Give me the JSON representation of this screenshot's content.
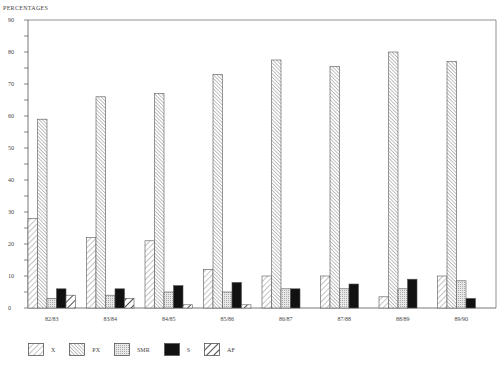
{
  "chart_data": {
    "type": "bar",
    "title": "",
    "ylabel": "PERCENTAGES",
    "xlabel": "",
    "ylim": [
      0,
      90
    ],
    "yticks": [
      0,
      10,
      20,
      30,
      40,
      50,
      60,
      70,
      80,
      90
    ],
    "grid": false,
    "legend_position": "bottom",
    "categories": [
      "82/83",
      "83/84",
      "84/85",
      "85/86",
      "86/87",
      "87/88",
      "88/89",
      "89/90"
    ],
    "series": [
      {
        "name": "X",
        "pattern": "diag-light",
        "values": [
          28,
          22,
          21,
          12,
          10,
          10,
          3.5,
          10
        ]
      },
      {
        "name": "PX",
        "pattern": "diag-dense",
        "values": [
          59,
          66,
          67,
          73,
          77.5,
          75.5,
          80,
          77
        ]
      },
      {
        "name": "SMR",
        "pattern": "dots",
        "values": [
          3,
          4,
          5,
          5,
          6,
          6,
          6,
          8.5
        ]
      },
      {
        "name": "S",
        "pattern": "solid-black",
        "values": [
          6,
          6,
          7,
          8,
          6,
          7.5,
          9,
          3
        ]
      },
      {
        "name": "AF",
        "pattern": "diag-bold",
        "values": [
          4,
          3,
          1,
          1,
          0,
          0,
          0,
          0
        ]
      }
    ]
  },
  "legend": [
    {
      "label": "X"
    },
    {
      "label": "PX"
    },
    {
      "label": "SMR"
    },
    {
      "label": "S"
    },
    {
      "label": "AF"
    }
  ]
}
